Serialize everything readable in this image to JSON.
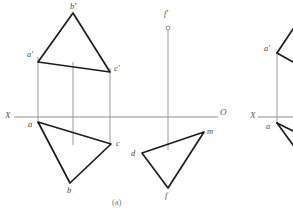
{
  "figure": {
    "caption": "(a)",
    "colors": {
      "edge": "#1d1d1d",
      "projection_line": "#9a9a9a",
      "axis": "#8d8d8d",
      "label": "#4a4a4a",
      "background": "#ffffff"
    },
    "axis": {
      "x_label": "X",
      "o_label": "O",
      "y": 117,
      "x_start": 14,
      "x_end": 218
    },
    "panel_a": {
      "frontal_view": {
        "name": "triangle-a-b-c-frontal",
        "vertices": [
          {
            "id": "a_prime",
            "label": "a'",
            "x": 38,
            "y": 62,
            "label_x": 27,
            "label_y": 57
          },
          {
            "id": "b_prime",
            "label": "b'",
            "x": 73,
            "y": 13,
            "label_x": 70,
            "label_y": 9
          },
          {
            "id": "c_prime",
            "label": "c'",
            "x": 110,
            "y": 72,
            "label_x": 114,
            "label_y": 71
          }
        ]
      },
      "horizontal_view": {
        "name": "triangle-a-b-c-horizontal",
        "vertices": [
          {
            "id": "a",
            "label": "a",
            "x": 38,
            "y": 122,
            "label_x": 28,
            "label_y": 127
          },
          {
            "id": "b",
            "label": "b",
            "x": 70,
            "y": 183,
            "label_x": 67,
            "label_y": 193
          },
          {
            "id": "c",
            "label": "c",
            "x": 111,
            "y": 144,
            "label_x": 116,
            "label_y": 146
          }
        ]
      },
      "projection_lines": [
        {
          "name": "projector-a",
          "x": 38,
          "y1": 57,
          "y2": 124
        },
        {
          "name": "projector-b",
          "x": 73,
          "y1": 62,
          "y2": 145
        },
        {
          "name": "projector-c",
          "x": 110,
          "y1": 68,
          "y2": 146
        }
      ],
      "second_figure": {
        "name": "triangle-d-f-m",
        "point_f_prime": {
          "id": "f_prime",
          "label": "f'",
          "x": 168,
          "y": 28,
          "label_x": 164,
          "label_y": 16,
          "radius": 2
        },
        "projector": {
          "name": "projector-f",
          "x": 168,
          "y1": 30,
          "y2": 150
        },
        "vertices": [
          {
            "id": "d",
            "label": "d",
            "x": 142,
            "y": 153,
            "label_x": 131,
            "label_y": 155
          },
          {
            "id": "f",
            "label": "f",
            "x": 168,
            "y": 188,
            "label_x": 165,
            "label_y": 197
          },
          {
            "id": "m",
            "label": "m",
            "x": 204,
            "y": 132,
            "label_x": 208,
            "label_y": 133
          }
        ]
      }
    },
    "panel_b_partial": {
      "name": "partial-second-figure",
      "axis": {
        "x_label": "X",
        "y": 117,
        "x_start": 258,
        "x_end": 293
      },
      "vertices": [
        {
          "id": "a_prime_b",
          "label": "a'",
          "x": 277,
          "y": 53,
          "label_x": 265,
          "label_y": 50
        },
        {
          "id": "a_b",
          "label": "a",
          "x": 277,
          "y": 123,
          "label_x": 267,
          "label_y": 128
        }
      ],
      "projector": {
        "name": "projector-a-partial",
        "x": 277,
        "y1": 53,
        "y2": 124
      },
      "edges": [
        {
          "name": "edge-upper-right-1",
          "x1": 277,
          "y1": 53,
          "x2": 293,
          "y2": 29
        },
        {
          "name": "edge-upper-right-2",
          "x1": 277,
          "y1": 53,
          "x2": 293,
          "y2": 62
        },
        {
          "name": "edge-lower-right-1",
          "x1": 277,
          "y1": 123,
          "x2": 293,
          "y2": 145
        },
        {
          "name": "edge-lower-right-2",
          "x1": 277,
          "y1": 123,
          "x2": 293,
          "y2": 131
        }
      ]
    }
  }
}
